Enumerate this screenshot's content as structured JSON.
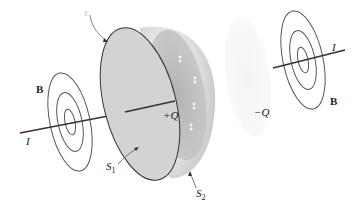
{
  "figure": {
    "labels": {
      "top_marker": "ε",
      "b_left": "B",
      "b_right": "B",
      "current_left": "I",
      "current_right": "I",
      "plus_q": "+Q",
      "minus_q": "−Q",
      "s1_base": "S",
      "s1_sub": "1",
      "s2_base": "S",
      "s2_sub": "2"
    },
    "colors": {
      "line": "#3a3a3a",
      "disc_fill": "#d4d4d4",
      "dome_outer": "#e6e6e6",
      "dome_inner": "#bdbdbd",
      "ghost_plate": "#f1f1f1"
    }
  }
}
